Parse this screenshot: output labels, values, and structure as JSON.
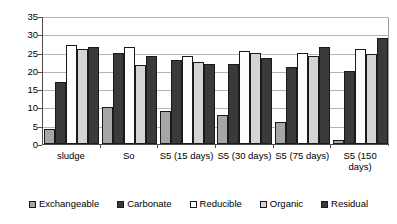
{
  "chart_data": {
    "type": "bar",
    "title": "",
    "subtitle": "",
    "xlabel": "",
    "ylabel": "",
    "ylim": [
      0,
      35
    ],
    "ytick_step": 5,
    "yticks": [
      35,
      30,
      25,
      20,
      15,
      10,
      5,
      0
    ],
    "grid": true,
    "legend_position": "bottom",
    "categories": [
      "sludge",
      "So",
      "S5 (15 days)",
      "S5 (30 days)",
      "S5 (75 days)",
      "S5 (150 days)"
    ],
    "series": [
      {
        "name": "Exchangeable",
        "color": "#a6a6a6",
        "values": [
          4,
          10,
          9,
          8,
          6,
          1
        ]
      },
      {
        "name": "Carbonate",
        "color": "#3a3a3a",
        "values": [
          17,
          25,
          23,
          22,
          21,
          20
        ]
      },
      {
        "name": "Reducible",
        "color": "#fdfdfd",
        "values": [
          27,
          26.5,
          24,
          25.5,
          25,
          26
        ]
      },
      {
        "name": "Organic",
        "color": "#d4d4d4",
        "values": [
          26,
          21.5,
          22.5,
          25,
          24,
          24.5
        ]
      },
      {
        "name": "Residual",
        "color": "#3a3a3a",
        "values": [
          26.5,
          24,
          22,
          23.5,
          26.5,
          29
        ]
      }
    ]
  },
  "legend": {
    "items": [
      {
        "label": "Exchangeable"
      },
      {
        "label": "Carbonate"
      },
      {
        "label": "Reducible"
      },
      {
        "label": "Organic"
      },
      {
        "label": "Residual"
      }
    ]
  }
}
